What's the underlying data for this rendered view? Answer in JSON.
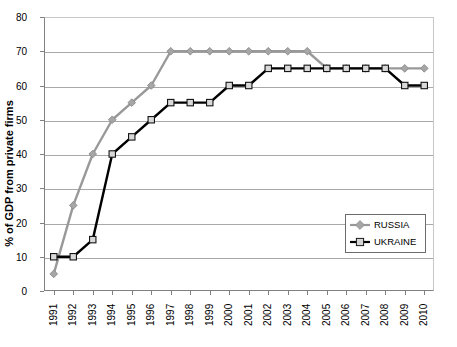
{
  "chart_data": {
    "type": "line",
    "title": "",
    "xlabel": "",
    "ylabel": "% of GDP from private firms",
    "ylim": [
      0,
      80
    ],
    "ytick_step": 10,
    "yticks": [
      0,
      10,
      20,
      30,
      40,
      50,
      60,
      70,
      80
    ],
    "grid": true,
    "legend_position": "inside-bottom-right",
    "categories": [
      "1991",
      "1992",
      "1993",
      "1994",
      "1995",
      "1996",
      "1997",
      "1998",
      "1999",
      "2000",
      "2001",
      "2002",
      "2003",
      "2004",
      "2005",
      "2006",
      "2007",
      "2008",
      "2009",
      "2010"
    ],
    "series": [
      {
        "name": "RUSSIA",
        "color": "#999999",
        "marker": "diamond",
        "values": [
          5,
          25,
          40,
          50,
          55,
          60,
          70,
          70,
          70,
          70,
          70,
          70,
          70,
          70,
          65,
          65,
          65,
          65,
          65,
          65
        ]
      },
      {
        "name": "UKRAINE",
        "color": "#000000",
        "marker": "square",
        "values": [
          10,
          10,
          15,
          40,
          45,
          50,
          55,
          55,
          55,
          60,
          60,
          65,
          65,
          65,
          65,
          65,
          65,
          65,
          60,
          60
        ]
      }
    ]
  },
  "legend": {
    "items": [
      {
        "label": "RUSSIA"
      },
      {
        "label": "UKRAINE"
      }
    ]
  }
}
